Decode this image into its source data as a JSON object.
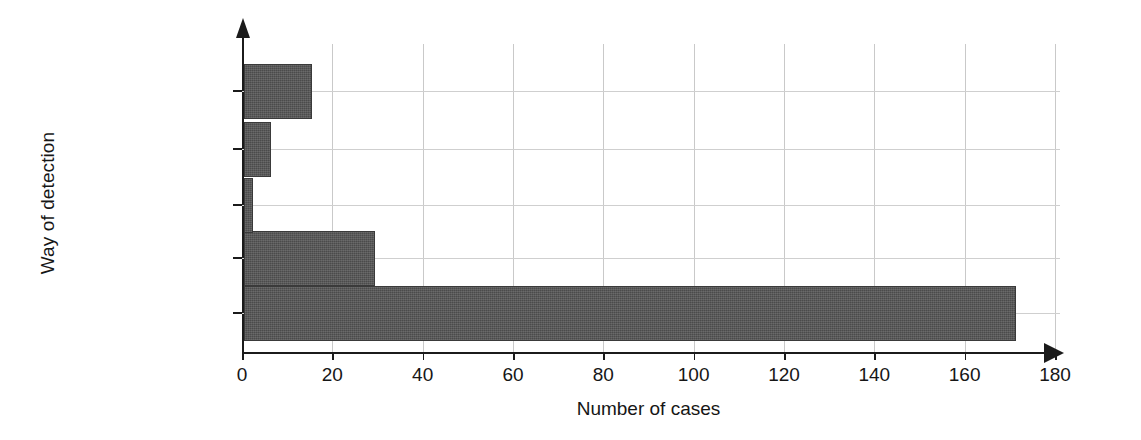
{
  "chart_data": {
    "type": "bar",
    "orientation": "horizontal",
    "title": "",
    "xlabel": "Number of cases",
    "ylabel": "Way of detection",
    "categories": [
      "External",
      "Internal (Other)",
      "Internal (HIDS)",
      "Internal (NIDS)",
      "Unknown"
    ],
    "values": [
      171,
      29,
      2,
      6,
      15
    ],
    "xlim": [
      0,
      180
    ],
    "xticks": [
      0,
      20,
      40,
      60,
      80,
      100,
      120,
      140,
      160,
      180
    ],
    "xtick_labels": [
      "0",
      "20",
      "40",
      "60",
      "80",
      "100",
      "120",
      "140",
      "160",
      "180"
    ],
    "grid": true,
    "legend": false,
    "bar_color": "#4b4b4b",
    "axis_color": "#1b1b1b",
    "grid_color": "#c9c9c9",
    "background": "#ffffff"
  },
  "axes": {
    "y_title": "Way of detection",
    "x_title": "Number of cases"
  }
}
